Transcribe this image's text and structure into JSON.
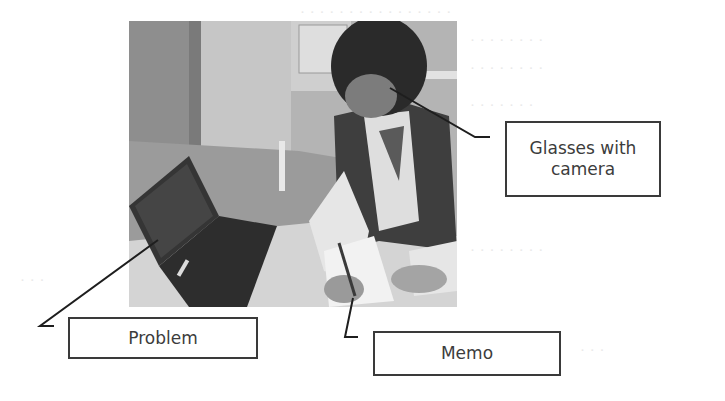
{
  "figure": {
    "labels": {
      "glasses": "Glasses with camera",
      "problem": "Problem",
      "memo": "Memo"
    },
    "colors": {
      "box_border": "#3a3a3a",
      "label_text": "#3c3c3c",
      "callout_line": "#1e1e1e",
      "bleed_text": "#e9e9e9"
    }
  }
}
